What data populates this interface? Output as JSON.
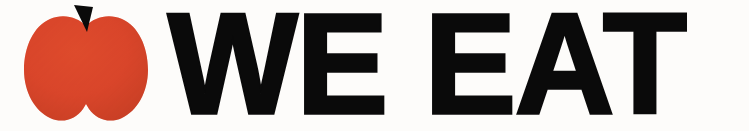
{
  "canvas": {
    "width": 749,
    "height": 131,
    "background_color": "#fdfcfa"
  },
  "logo": {
    "name": "apple-logo",
    "description": "stylized two-lobe apple silhouette with black stem",
    "body_color": "#d9452a",
    "body_shade_color": "#c53d22",
    "stem_color": "#0a0a0a",
    "stem_shape": "downward-tapering-wedge"
  },
  "wordmark": {
    "text": "WE EAT",
    "words": [
      "WE",
      "EAT"
    ],
    "color": "#0a0a0a",
    "weight": "black",
    "case": "uppercase"
  }
}
